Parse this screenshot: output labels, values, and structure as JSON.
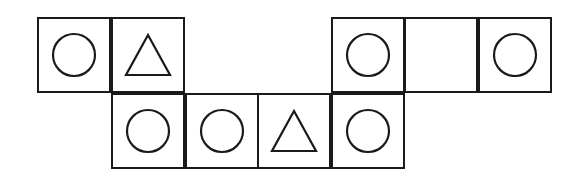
{
  "figure": {
    "background_color": "#ffffff",
    "stroke_color": "#1a1a1a",
    "cell_width": 74,
    "cell_height": 76,
    "columns": 7,
    "rows": 2,
    "origin_x": 37,
    "origin_y": 17,
    "cells": [
      {
        "row": 0,
        "col": 0,
        "shape": "circle",
        "x": 37,
        "y": 17,
        "present": true
      },
      {
        "row": 0,
        "col": 1,
        "shape": "triangle",
        "x": 111,
        "y": 17,
        "present": true
      },
      {
        "row": 0,
        "col": 2,
        "shape": "none",
        "x": 185,
        "y": 17,
        "present": false
      },
      {
        "row": 0,
        "col": 3,
        "shape": "none",
        "x": 257,
        "y": 17,
        "present": false
      },
      {
        "row": 0,
        "col": 4,
        "shape": "circle",
        "x": 331,
        "y": 17,
        "present": true
      },
      {
        "row": 0,
        "col": 5,
        "shape": "empty",
        "x": 404,
        "y": 17,
        "present": true
      },
      {
        "row": 0,
        "col": 6,
        "shape": "circle",
        "x": 478,
        "y": 17,
        "present": true
      },
      {
        "row": 1,
        "col": 0,
        "shape": "none",
        "x": 37,
        "y": 93,
        "present": false
      },
      {
        "row": 1,
        "col": 1,
        "shape": "circle",
        "x": 111,
        "y": 93,
        "present": true
      },
      {
        "row": 1,
        "col": 2,
        "shape": "circle",
        "x": 185,
        "y": 93,
        "present": true
      },
      {
        "row": 1,
        "col": 3,
        "shape": "triangle",
        "x": 257,
        "y": 93,
        "present": true
      },
      {
        "row": 1,
        "col": 4,
        "shape": "circle",
        "x": 331,
        "y": 93,
        "present": true
      },
      {
        "row": 1,
        "col": 5,
        "shape": "none",
        "x": 404,
        "y": 93,
        "present": false
      },
      {
        "row": 1,
        "col": 6,
        "shape": "none",
        "x": 478,
        "y": 93,
        "present": false
      }
    ],
    "shape_counts": {
      "circle": 6,
      "triangle": 2,
      "empty": 1
    }
  }
}
